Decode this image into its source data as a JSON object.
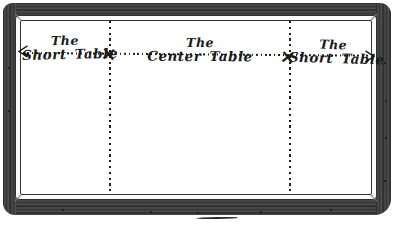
{
  "figure": {
    "sections": [
      {
        "line1": "The",
        "line2": "Short Table"
      },
      {
        "line1": "The",
        "line2": "Center Table"
      },
      {
        "line1": "The",
        "line2": "Short Table"
      }
    ],
    "markers": {
      "divider": "×"
    },
    "icons": {
      "left_end": "arrow-left-icon",
      "right_end": "arrow-right-icon",
      "junction": "x-mark-icon"
    },
    "colors": {
      "ink": "#1e1e1e",
      "frame_wood": "#3a3a3a",
      "background": "#ffffff"
    }
  }
}
